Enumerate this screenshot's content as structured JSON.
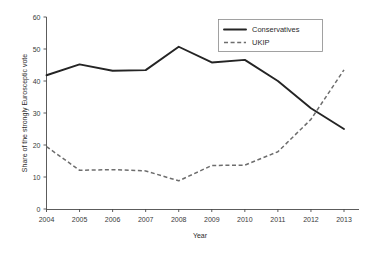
{
  "chart_data": {
    "type": "line",
    "title": "",
    "xlabel": "Year",
    "ylabel": "Share of the strongly Eurosceptic vote",
    "x": [
      2004,
      2005,
      2006,
      2007,
      2008,
      2009,
      2010,
      2011,
      2012,
      2013
    ],
    "xtick_labels": [
      "2004",
      "2005",
      "2006",
      "2007",
      "2008",
      "2009",
      "2010",
      "2011",
      "2012",
      "2013"
    ],
    "ytick_labels": [
      "0",
      "10",
      "20",
      "30",
      "40",
      "50",
      "60"
    ],
    "yticks": [
      0,
      10,
      20,
      30,
      40,
      50,
      60
    ],
    "ylim": [
      0,
      60
    ],
    "xlim": [
      2004,
      2013
    ],
    "grid": false,
    "legend_position": "top-right",
    "series": [
      {
        "name": "Conservatives",
        "style": "solid",
        "color": "#242424",
        "values": [
          41.8,
          45.2,
          43.2,
          43.4,
          50.7,
          45.8,
          46.6,
          40.0,
          31.5,
          25.0
        ]
      },
      {
        "name": "UKIP",
        "style": "dashed",
        "color": "#6d6d6d",
        "values": [
          19.5,
          12.1,
          12.3,
          11.9,
          8.8,
          13.6,
          13.7,
          17.9,
          28.0,
          43.5
        ]
      }
    ]
  },
  "legend": {
    "items": [
      {
        "label": "Conservatives"
      },
      {
        "label": "UKIP"
      }
    ]
  },
  "axes": {
    "x_title": "Year",
    "y_title": "Share of the strongly Eurosceptic vote"
  }
}
